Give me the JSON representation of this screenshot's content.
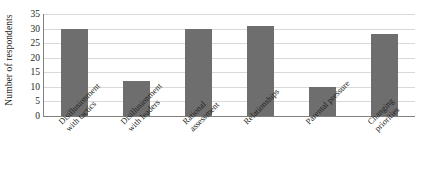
{
  "chart_data": {
    "type": "bar",
    "title": "",
    "xlabel": "",
    "ylabel": "Number of respondents",
    "categories": [
      "Disillusionment with tactics",
      "Disillusionment with leaders",
      "Rational assessment",
      "Relationships",
      "Parental pressure",
      "Changing priorities"
    ],
    "values": [
      30,
      12,
      30,
      31,
      10,
      28
    ],
    "ylim": [
      0,
      35
    ],
    "yticks": [
      0,
      5,
      10,
      15,
      20,
      25,
      30,
      35
    ],
    "ytick_labels": [
      "0",
      "5",
      "10",
      "15",
      "20",
      "25",
      "30",
      "35"
    ],
    "grid": true,
    "legend": false,
    "bar_color": "#6e6e6e",
    "gridline_color": "#d9d9d9",
    "axis_color": "#808080",
    "text_color": "#231f20",
    "background_color": "#ffffff"
  }
}
